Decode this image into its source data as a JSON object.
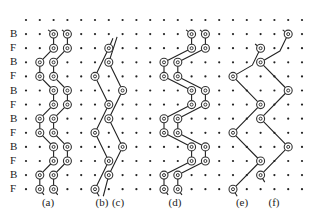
{
  "grid": {
    "cols": 21,
    "rows": 13,
    "x0": 26,
    "y0": 20,
    "dx": 13.8,
    "dy": 14.1,
    "dot_color": "#222222",
    "line_color": "#222222",
    "circle_color": "#333333"
  },
  "row_labels": [
    "",
    "B",
    "F",
    "B",
    "F",
    "B",
    "F",
    "B",
    "F",
    "B",
    "F",
    "B",
    "F"
  ],
  "panels": [
    {
      "id": "a",
      "label": "(a)",
      "label_x": 48,
      "circles": [
        [
          2,
          1
        ],
        [
          3,
          1
        ],
        [
          2,
          2
        ],
        [
          3,
          2
        ],
        [
          1,
          3
        ],
        [
          2,
          3
        ],
        [
          1,
          4
        ],
        [
          2,
          4
        ],
        [
          2,
          5
        ],
        [
          3,
          5
        ],
        [
          2,
          6
        ],
        [
          3,
          6
        ],
        [
          1,
          7
        ],
        [
          2,
          7
        ],
        [
          1,
          8
        ],
        [
          2,
          8
        ],
        [
          2,
          9
        ],
        [
          3,
          9
        ],
        [
          2,
          10
        ],
        [
          3,
          10
        ],
        [
          1,
          11
        ],
        [
          2,
          11
        ],
        [
          1,
          12
        ],
        [
          2,
          12
        ]
      ],
      "paths": [
        [
          [
            1.6,
            0.7
          ],
          [
            2,
            1
          ],
          [
            2,
            2
          ],
          [
            1,
            3
          ],
          [
            1,
            4
          ],
          [
            2,
            5
          ],
          [
            2,
            6
          ],
          [
            1,
            7
          ],
          [
            1,
            8
          ],
          [
            2,
            9
          ],
          [
            2,
            10
          ],
          [
            1,
            11
          ],
          [
            1,
            12
          ],
          [
            1.3,
            12.4
          ]
        ],
        [
          [
            2.6,
            0.7
          ],
          [
            3,
            1
          ],
          [
            3,
            2
          ],
          [
            2,
            3
          ],
          [
            2,
            4
          ],
          [
            3,
            5
          ],
          [
            3,
            6
          ],
          [
            2,
            7
          ],
          [
            2,
            8
          ],
          [
            3,
            9
          ],
          [
            3,
            10
          ],
          [
            2,
            11
          ],
          [
            2,
            12
          ],
          [
            2.3,
            12.4
          ]
        ]
      ]
    },
    {
      "id": "b",
      "label": "(b)",
      "label_x": 102,
      "circles": [
        [
          6,
          2
        ],
        [
          5,
          4
        ],
        [
          6,
          6
        ],
        [
          5,
          8
        ],
        [
          6,
          10
        ],
        [
          5,
          12
        ]
      ],
      "paths": [
        [
          [
            6.3,
            1.3
          ],
          [
            6,
            2
          ],
          [
            5,
            4
          ],
          [
            6,
            6
          ],
          [
            5,
            8
          ],
          [
            6,
            10
          ],
          [
            5,
            12
          ],
          [
            5.3,
            12.5
          ]
        ]
      ]
    },
    {
      "id": "c",
      "label": "(c)",
      "label_x": 118,
      "circles": [
        [
          6,
          3
        ],
        [
          7,
          5
        ],
        [
          6,
          7
        ],
        [
          7,
          9
        ],
        [
          6,
          11
        ]
      ],
      "paths": [
        [
          [
            6.6,
            1.2
          ],
          [
            6,
            3
          ],
          [
            7,
            5
          ],
          [
            6,
            7
          ],
          [
            7,
            9
          ],
          [
            6,
            11
          ],
          [
            5.6,
            12.5
          ]
        ]
      ]
    },
    {
      "id": "d",
      "label": "(d)",
      "label_x": 175,
      "circles": [
        [
          12,
          1
        ],
        [
          13,
          1
        ],
        [
          12,
          2
        ],
        [
          13,
          2
        ],
        [
          10,
          3
        ],
        [
          11,
          3
        ],
        [
          10,
          4
        ],
        [
          11,
          4
        ],
        [
          12,
          5
        ],
        [
          13,
          5
        ],
        [
          12,
          6
        ],
        [
          13,
          6
        ],
        [
          10,
          7
        ],
        [
          11,
          7
        ],
        [
          10,
          8
        ],
        [
          11,
          8
        ],
        [
          12,
          9
        ],
        [
          13,
          9
        ],
        [
          12,
          10
        ],
        [
          13,
          10
        ],
        [
          10,
          11
        ],
        [
          11,
          11
        ],
        [
          10,
          12
        ],
        [
          11,
          12
        ]
      ],
      "paths": [
        [
          [
            11.6,
            0.7
          ],
          [
            12,
            1
          ],
          [
            12,
            2
          ],
          [
            10,
            3
          ],
          [
            10,
            4
          ],
          [
            12,
            5
          ],
          [
            12,
            6
          ],
          [
            10,
            7
          ],
          [
            10,
            8
          ],
          [
            12,
            9
          ],
          [
            12,
            10
          ],
          [
            10,
            11
          ],
          [
            10,
            12
          ],
          [
            10.3,
            12.4
          ]
        ],
        [
          [
            12.6,
            0.7
          ],
          [
            13,
            1
          ],
          [
            13,
            2
          ],
          [
            11,
            3
          ],
          [
            11,
            4
          ],
          [
            13,
            5
          ],
          [
            13,
            6
          ],
          [
            11,
            7
          ],
          [
            11,
            8
          ],
          [
            13,
            9
          ],
          [
            13,
            10
          ],
          [
            11,
            11
          ],
          [
            11,
            12
          ],
          [
            11.3,
            12.4
          ]
        ]
      ]
    },
    {
      "id": "e",
      "label": "(e)",
      "label_x": 242,
      "circles": [
        [
          17,
          2
        ],
        [
          15,
          4
        ],
        [
          17,
          6
        ],
        [
          15,
          8
        ],
        [
          17,
          10
        ],
        [
          15,
          12
        ]
      ],
      "paths": [
        [
          [
            16.6,
            1.7
          ],
          [
            17,
            2
          ],
          [
            16.4,
            3.2
          ],
          [
            15,
            4
          ],
          [
            17,
            6
          ],
          [
            15,
            8
          ],
          [
            17,
            10
          ],
          [
            15,
            12
          ],
          [
            15.3,
            12.5
          ]
        ]
      ]
    },
    {
      "id": "f",
      "label": "(f)",
      "label_x": 274,
      "circles": [
        [
          19,
          1
        ],
        [
          17,
          3
        ],
        [
          19,
          5
        ],
        [
          17,
          7
        ],
        [
          19,
          9
        ],
        [
          17,
          11
        ]
      ],
      "paths": [
        [
          [
            18.6,
            0.7
          ],
          [
            19,
            1
          ],
          [
            18.4,
            2.2
          ],
          [
            17,
            3
          ],
          [
            19,
            5
          ],
          [
            17,
            7
          ],
          [
            19,
            9
          ],
          [
            17,
            11
          ],
          [
            17.3,
            11.5
          ]
        ]
      ]
    }
  ],
  "panel_label_y": 203
}
